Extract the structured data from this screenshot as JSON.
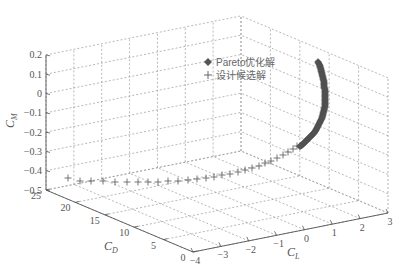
{
  "chart_data": {
    "type": "scatter3d",
    "title": "",
    "axes": {
      "x": {
        "label": "C_L",
        "label_main": "C",
        "label_sub": "L",
        "ticks": [
          -4,
          -3,
          -2,
          -1,
          0,
          1,
          2,
          3
        ],
        "range": [
          -4,
          3
        ]
      },
      "y": {
        "label": "C_D",
        "label_main": "C",
        "label_sub": "D",
        "ticks": [
          0,
          5,
          10,
          15,
          20,
          25
        ],
        "range": [
          0,
          25
        ]
      },
      "z": {
        "label": "C_M",
        "label_main": "C",
        "label_sub": "M",
        "ticks": [
          0.2,
          0.1,
          0,
          -0.1,
          -0.2,
          -0.3,
          -0.4,
          -0.5
        ],
        "tick_labels": [
          "0.2",
          "0.1",
          "0",
          "−0.1",
          "−0.2",
          "−0.3",
          "−0.4",
          "−0.5"
        ],
        "range": [
          -0.5,
          0.2
        ]
      }
    },
    "grid": true,
    "legend": {
      "position": "upper-inside",
      "entries": [
        {
          "label": "Pareto优化解",
          "marker": "diamond",
          "color": "#555555"
        },
        {
          "label": "设计候选解",
          "marker": "plus",
          "color": "#777777"
        }
      ]
    },
    "series": [
      {
        "name": "Pareto优化解",
        "marker": "diamond",
        "description": "Dense curved arc of filled diamonds rising from about C_M -0.25 to 0.1, near C_L 1.5-2.5, low C_D",
        "points_px": [
          [
            318,
            62
          ],
          [
            320,
            66
          ],
          [
            321,
            70
          ],
          [
            322,
            74
          ],
          [
            323,
            78
          ],
          [
            324,
            82
          ],
          [
            324,
            86
          ],
          [
            325,
            90
          ],
          [
            325,
            94
          ],
          [
            325,
            98
          ],
          [
            325,
            102
          ],
          [
            325,
            106
          ],
          [
            324,
            110
          ],
          [
            323,
            114
          ],
          [
            322,
            118
          ],
          [
            320,
            122
          ],
          [
            318,
            126
          ],
          [
            316,
            130
          ],
          [
            314,
            133
          ],
          [
            311,
            136
          ],
          [
            308,
            139
          ],
          [
            305,
            142
          ],
          [
            302,
            145
          ],
          [
            299,
            147
          ]
        ]
      },
      {
        "name": "设计候选解",
        "marker": "plus",
        "description": "Row of plus markers along the C_M ≈ -0.45 floor, sweeping from C_D ≈ 25 / C_L ≈ -4 to the Pareto arc",
        "points_px": [
          [
            68,
            178
          ],
          [
            80,
            181
          ],
          [
            91,
            181
          ],
          [
            103,
            181
          ],
          [
            115,
            182
          ],
          [
            127,
            182
          ],
          [
            138,
            182
          ],
          [
            148,
            182
          ],
          [
            158,
            182
          ],
          [
            168,
            181
          ],
          [
            178,
            181
          ],
          [
            188,
            180
          ],
          [
            197,
            179
          ],
          [
            206,
            178
          ],
          [
            214,
            177
          ],
          [
            222,
            175
          ],
          [
            230,
            174
          ],
          [
            238,
            172
          ],
          [
            245,
            170
          ],
          [
            252,
            168
          ],
          [
            259,
            166
          ],
          [
            265,
            163
          ],
          [
            271,
            161
          ],
          [
            277,
            158
          ],
          [
            283,
            155
          ],
          [
            288,
            152
          ],
          [
            293,
            149
          ],
          [
            297,
            146
          ]
        ]
      }
    ]
  }
}
